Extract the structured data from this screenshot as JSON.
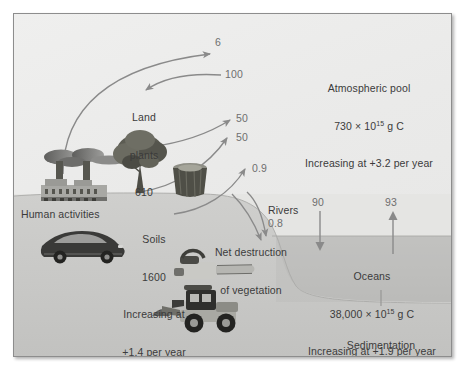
{
  "figure": {
    "type": "carbon-cycle-diagram",
    "units_note": "g C",
    "colors": {
      "plate_bg": "#ececeb",
      "land": "#c9c9c7",
      "ocean": "#bdbdbb",
      "seabed": "#e3e3e1",
      "text": "#3b3b3b",
      "flow_text": "#6f6f6f",
      "arrow": "#8a8a8a",
      "frame": "#8d8d8d"
    }
  },
  "pools": {
    "atmosphere": {
      "name": "Atmospheric pool",
      "stock_value": "730",
      "stock_mult": " × 10",
      "stock_exp": "15",
      "stock_units": " g C",
      "trend": "Increasing at +3.2 per year"
    },
    "land_plants": {
      "name_line1": "Land",
      "name_line2": "plants",
      "stock_value": "610"
    },
    "soils": {
      "name": "Soils",
      "stock_value": "1600",
      "trend_line1": "Increasing at",
      "trend_line2": "+1.4 per year"
    },
    "oceans": {
      "name": "Oceans",
      "stock_value": "38,000",
      "stock_mult": " × 10",
      "stock_exp": "15",
      "stock_units": " g C",
      "trend": "Increasing at +1.9 per year"
    }
  },
  "processes": {
    "human_activities": "Human activities",
    "net_destruction_line1": "Net destruction",
    "net_destruction_line2": "of vegetation",
    "rivers": "Rivers",
    "sedimentation": "Sedimentation"
  },
  "flows": [
    {
      "id": "fossil-fuel-combustion",
      "value": "6",
      "from": "human activities",
      "to": "atmosphere"
    },
    {
      "id": "photosynthesis",
      "value": "100",
      "from": "atmosphere",
      "to": "land plants"
    },
    {
      "id": "plant-respiration",
      "value": "50",
      "from": "land plants",
      "to": "atmosphere"
    },
    {
      "id": "soil-respiration",
      "value": "50",
      "from": "soils",
      "to": "atmosphere"
    },
    {
      "id": "deforestation-flux",
      "value": "0.9",
      "from": "net destruction",
      "to": "atmosphere"
    },
    {
      "id": "river-transport",
      "value": "0.8",
      "from": "land",
      "to": "oceans"
    },
    {
      "id": "ocean-uptake",
      "value": "90",
      "from": "atmosphere",
      "to": "oceans"
    },
    {
      "id": "ocean-release",
      "value": "93",
      "from": "oceans",
      "to": "atmosphere"
    },
    {
      "id": "sedimentation-flux",
      "value": "3",
      "from": "oceans",
      "to": "sediments"
    }
  ]
}
